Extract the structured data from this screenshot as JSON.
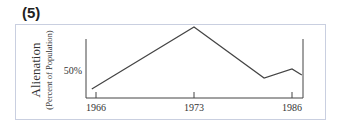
{
  "figure": {
    "label": "(5)"
  },
  "chart_data": {
    "type": "line",
    "title": "",
    "xlabel": "",
    "ylabel": "Alienation",
    "ylabel_sub": "(Percent of Population)",
    "x_ticks": [
      "1966",
      "1973",
      "1986"
    ],
    "y_ticks": [
      "50%"
    ],
    "grid": false,
    "legend": "none",
    "series": [
      {
        "name": "Alienation",
        "points": [
          {
            "x": 1965.7,
            "y": 40.5
          },
          {
            "x": 1973,
            "y": 71.5
          },
          {
            "x": 1982.3,
            "y": 46
          },
          {
            "x": 1986,
            "y": 50.5
          },
          {
            "x": 1987.3,
            "y": 47.5
          }
        ]
      }
    ],
    "xlim": [
      1965.3,
      1987.4
    ],
    "ylim": [
      35,
      80
    ]
  }
}
